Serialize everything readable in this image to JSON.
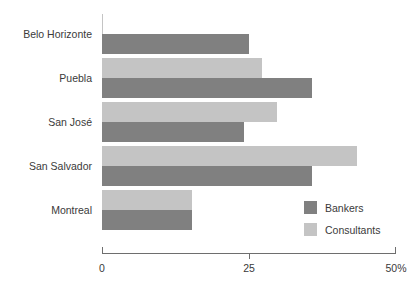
{
  "chart_data": {
    "type": "bar",
    "orientation": "horizontal",
    "title": "",
    "subtitle": "",
    "xlabel": "",
    "ylabel": "",
    "categories": [
      "Belo Horizonte",
      "Puebla",
      "San José",
      "San Salvador",
      "Montreal"
    ],
    "series": [
      {
        "name": "Bankers",
        "color": "#808080",
        "values": [
          25.0,
          35.7,
          24.2,
          35.7,
          15.3
        ]
      },
      {
        "name": "Consultants",
        "color": "#c4c4c4",
        "values": [
          0.2,
          27.2,
          29.8,
          43.4,
          15.3
        ]
      }
    ],
    "xlim": [
      0,
      50
    ],
    "xticks": [
      0,
      25,
      50
    ],
    "xtick_labels": [
      "0",
      "25",
      "50%"
    ],
    "grid": false,
    "legend_position": "bottom-right",
    "legend_entries": [
      {
        "label": "Bankers",
        "color": "#808080"
      },
      {
        "label": "Consultants",
        "color": "#c4c4c4"
      }
    ],
    "axis_color": "#6e6e6e",
    "text_color": "#3a3a3a",
    "background": "#ffffff"
  }
}
